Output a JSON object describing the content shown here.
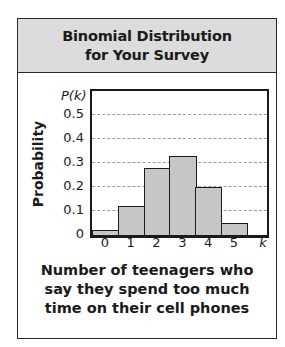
{
  "chart_data": {
    "type": "bar",
    "title": "Binomial Distribution for Your Survey",
    "title_lines": [
      "Binomial Distribution",
      "for Your Survey"
    ],
    "xlabel": "Number of teenagers who say they spend too much time on their cell phones",
    "xlabel_lines": [
      "Number of teenagers who",
      "say they spend too much",
      "time on their cell phones"
    ],
    "ylabel": "Probability",
    "y_variable": "P(k)",
    "x_variable": "k",
    "categories": [
      "0",
      "1",
      "2",
      "3",
      "4",
      "5"
    ],
    "values": [
      0.02,
      0.12,
      0.28,
      0.33,
      0.2,
      0.05
    ],
    "ylim": [
      0,
      0.55
    ],
    "yticks": [
      "0",
      "0.1",
      "0.2",
      "0.3",
      "0.4",
      "0.5"
    ],
    "grid": true,
    "grid_style": "dashed horizontal",
    "legend": null,
    "bar_color": "#c6c6c6",
    "header_color": "#dcdcdc"
  }
}
